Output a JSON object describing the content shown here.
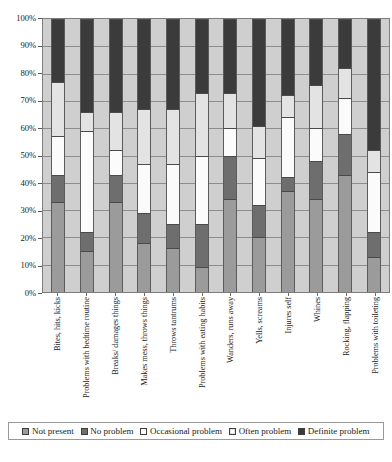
{
  "chart_data": {
    "type": "bar",
    "subtype": "stacked-bar-100-percent",
    "title": "",
    "xlabel": "",
    "ylabel": "",
    "ylim": [
      0,
      100
    ],
    "y_unit": "%",
    "grid": true,
    "legend_position": "bottom",
    "y_tick_labels": [
      "100%",
      "90%",
      "80%",
      "70%",
      "60%",
      "50%",
      "40%",
      "30%",
      "20%",
      "10%",
      "0%"
    ],
    "y_tick_values": [
      100,
      90,
      80,
      70,
      60,
      50,
      40,
      30,
      20,
      10,
      0
    ],
    "categories": [
      "Bites, hits, kicks",
      "Problems with bedtime routine",
      "Breaks/ damages things",
      "Makes mess, throws things",
      "Throws tantrums",
      "Problems with eating habits",
      "Wanders, runs away",
      "Yells, screams",
      "Injures self",
      "Whines",
      "Rocking, flapping",
      "Problems with toileting"
    ],
    "series": [
      {
        "name": "Not present",
        "color": "#9b9b9b",
        "values": [
          33,
          15,
          33,
          18,
          16,
          9,
          34,
          20,
          37,
          34,
          43,
          13
        ]
      },
      {
        "name": "No problem",
        "color": "#6e6e6e",
        "values": [
          10,
          7,
          10,
          11,
          9,
          16,
          16,
          12,
          5,
          14,
          15,
          9
        ]
      },
      {
        "name": "Occasional problem",
        "color": "#fbfbfb",
        "values": [
          14,
          37,
          9,
          18,
          22,
          25,
          10,
          17,
          22,
          12,
          13,
          22
        ]
      },
      {
        "name": "Often problem",
        "color": "#e3e3e3",
        "values": [
          20,
          7,
          14,
          20,
          20,
          23,
          13,
          12,
          8,
          16,
          11,
          8
        ]
      },
      {
        "name": "Definite problem",
        "color": "#3b3b3b",
        "values": [
          23,
          34,
          34,
          33,
          33,
          27,
          27,
          39,
          28,
          24,
          18,
          48
        ]
      }
    ],
    "plot_background": "#cfcfcf",
    "gridline_color": "#8d8d8d",
    "axis_color": "#7d7d7d"
  },
  "legend": {
    "items": [
      {
        "label": "Not present",
        "swatch": "medium-gray",
        "color": "#9b9b9b"
      },
      {
        "label": "No problem",
        "swatch": "dark-gray",
        "color": "#6e6e6e"
      },
      {
        "label": "Occasional problem",
        "swatch": "white",
        "color": "#fbfbfb"
      },
      {
        "label": "Often problem",
        "swatch": "light-gray",
        "color": "#e3e3e3"
      },
      {
        "label": "Definite problem",
        "swatch": "black",
        "color": "#3b3b3b"
      }
    ]
  }
}
